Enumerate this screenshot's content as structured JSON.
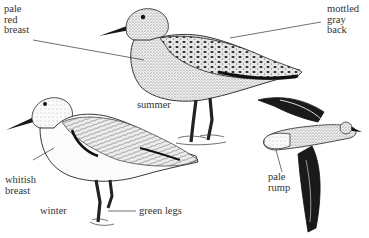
{
  "figure": {
    "ink_color": "#1a1a1a",
    "label_color": "#333333",
    "background": "#ffffff"
  },
  "labels": {
    "summer_breast": [
      "pale",
      "red",
      "breast"
    ],
    "summer_back": [
      "mottled",
      "gray",
      "back"
    ],
    "summer_caption": "summer",
    "winter_breast": [
      "whitish",
      "breast"
    ],
    "winter_caption": "winter",
    "winter_legs": "green legs",
    "flight_rump": [
      "pale",
      "rump"
    ]
  }
}
